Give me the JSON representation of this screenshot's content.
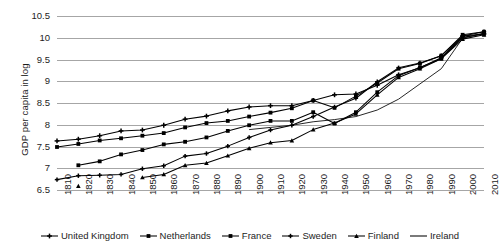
{
  "chart_data": {
    "type": "line",
    "title": "",
    "xlabel": "",
    "ylabel": "GDP per capita in log",
    "grid": true,
    "legend_position": "bottom",
    "xlim": [
      1810,
      2010
    ],
    "ylim": [
      6.5,
      10.5
    ],
    "ytick_labels": [
      "10.5",
      "10",
      "9.5",
      "9",
      "8.5",
      "8",
      "7.5",
      "7",
      "6.5"
    ],
    "ytick_values": [
      10.5,
      10,
      9.5,
      9,
      8.5,
      8,
      7.5,
      7,
      6.5
    ],
    "categories": [
      1810,
      1820,
      1830,
      1840,
      1850,
      1860,
      1870,
      1880,
      1890,
      1900,
      1910,
      1920,
      1930,
      1940,
      1950,
      1960,
      1970,
      1980,
      1990,
      2000,
      2010
    ],
    "x": [
      1810,
      1820,
      1830,
      1840,
      1850,
      1860,
      1870,
      1880,
      1890,
      1900,
      1910,
      1920,
      1930,
      1940,
      1950,
      1960,
      1970,
      1980,
      1990,
      2000,
      2010
    ],
    "series": [
      {
        "name": "United Kingdom",
        "marker": "cross",
        "values": [
          7.64,
          7.68,
          7.76,
          7.87,
          7.89,
          8.0,
          8.14,
          8.21,
          8.33,
          8.42,
          8.45,
          8.45,
          8.57,
          8.7,
          8.72,
          8.92,
          9.16,
          9.32,
          9.55,
          10.05,
          10.1
        ]
      },
      {
        "name": "Netherlands",
        "marker": "square",
        "values": [
          7.5,
          7.57,
          7.65,
          7.7,
          7.76,
          7.82,
          7.95,
          8.05,
          8.1,
          8.2,
          8.29,
          8.39,
          8.57,
          8.4,
          8.67,
          8.97,
          9.3,
          9.42,
          9.6,
          10.08,
          10.15
        ]
      },
      {
        "name": "France",
        "marker": "square",
        "values": [
          null,
          7.08,
          7.17,
          7.33,
          7.43,
          7.56,
          7.62,
          7.72,
          7.87,
          8.0,
          8.1,
          8.1,
          8.3,
          8.04,
          8.3,
          8.76,
          9.14,
          9.33,
          9.53,
          10.02,
          10.1
        ]
      },
      {
        "name": "Sweden",
        "marker": "cross-small",
        "values": [
          6.75,
          6.84,
          6.85,
          6.87,
          7.0,
          7.07,
          7.29,
          7.35,
          7.52,
          7.72,
          7.89,
          8.0,
          8.2,
          8.42,
          8.62,
          9.0,
          9.32,
          9.43,
          9.6,
          10.05,
          10.15
        ]
      },
      {
        "name": "Finland",
        "marker": "triangle",
        "values": [
          null,
          6.6,
          null,
          null,
          6.8,
          6.87,
          7.08,
          7.13,
          7.3,
          7.47,
          7.6,
          7.65,
          7.9,
          8.05,
          8.26,
          8.7,
          9.1,
          9.3,
          9.53,
          9.98,
          10.08
        ]
      },
      {
        "name": "Ireland",
        "marker": "none",
        "values": [
          null,
          null,
          null,
          null,
          null,
          null,
          null,
          null,
          null,
          7.9,
          7.95,
          8.0,
          8.08,
          8.13,
          8.2,
          8.35,
          8.6,
          8.95,
          9.3,
          10.0,
          10.12
        ]
      }
    ]
  },
  "legend": {
    "items": [
      {
        "label": "United Kingdom",
        "marker": "cross"
      },
      {
        "label": "Netherlands",
        "marker": "square"
      },
      {
        "label": "France",
        "marker": "square"
      },
      {
        "label": "Sweden",
        "marker": "cross-small"
      },
      {
        "label": "Finland",
        "marker": "triangle"
      },
      {
        "label": "Ireland",
        "marker": "none"
      }
    ]
  },
  "colors": {
    "line": "#000000",
    "grid": "#a6a6a6",
    "text": "#1d1d1d",
    "background": "#ffffff"
  }
}
